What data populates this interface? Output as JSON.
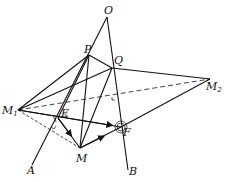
{
  "diagram": {
    "type": "3D geometry: dihedral angle construction",
    "points": {
      "O": {
        "x": 107,
        "y": 17,
        "label": "O"
      },
      "P": {
        "x": 89,
        "y": 55,
        "label": "P"
      },
      "Q": {
        "x": 112,
        "y": 68,
        "label": "Q"
      },
      "M1": {
        "x": 18,
        "y": 110,
        "label": "M",
        "sub": "1"
      },
      "M2": {
        "x": 210,
        "y": 79,
        "label": "M",
        "sub": "2"
      },
      "E": {
        "x": 58,
        "y": 118,
        "label": "E"
      },
      "F": {
        "x": 121,
        "y": 127,
        "label": "F"
      },
      "M": {
        "x": 80,
        "y": 148,
        "label": "M"
      },
      "A": {
        "x": 32,
        "y": 165,
        "label": "A"
      },
      "B": {
        "x": 128,
        "y": 170,
        "label": "B"
      }
    },
    "solid_segments": [
      [
        "O",
        "A"
      ],
      [
        "O",
        "B"
      ],
      [
        "M1",
        "P"
      ],
      [
        "M1",
        "Q"
      ],
      [
        "P",
        "Q"
      ],
      [
        "Q",
        "M2"
      ],
      [
        "M2",
        "F"
      ],
      [
        "P",
        "E"
      ],
      [
        "P",
        "M"
      ],
      [
        "Q",
        "M"
      ],
      [
        "M1",
        "F"
      ],
      [
        "E",
        "M"
      ],
      [
        "M",
        "F"
      ]
    ],
    "dashed_segments": [
      [
        "M1",
        "M2"
      ],
      [
        "M1",
        "M"
      ]
    ],
    "arrows": [
      [
        "E",
        "M"
      ],
      [
        "M",
        "F"
      ],
      [
        "M1",
        "F"
      ]
    ]
  }
}
